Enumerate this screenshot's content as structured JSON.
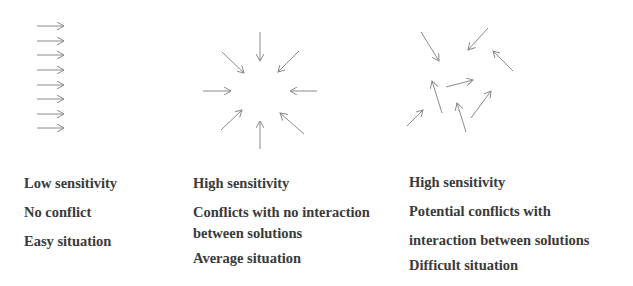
{
  "arrow_color": "#8a8a8a",
  "text_color": "#3a3a3a",
  "panels": [
    {
      "name": "parallel",
      "arrows": [
        [
          37,
          26,
          64,
          26
        ],
        [
          37,
          41,
          64,
          41
        ],
        [
          37,
          55,
          64,
          55
        ],
        [
          37,
          70,
          64,
          70
        ],
        [
          37,
          85,
          64,
          85
        ],
        [
          37,
          99,
          64,
          99
        ],
        [
          37,
          114,
          64,
          114
        ],
        [
          37,
          128,
          64,
          128
        ]
      ],
      "lines": [
        "Low sensitivity",
        "No conflict",
        "Easy situation"
      ]
    },
    {
      "name": "converging",
      "arrows": [
        [
          260,
          32,
          260,
          61
        ],
        [
          222,
          52,
          244,
          73
        ],
        [
          299,
          51,
          278,
          72
        ],
        [
          203,
          91,
          231,
          91
        ],
        [
          317,
          91,
          290,
          91
        ],
        [
          221,
          130,
          242,
          110
        ],
        [
          260,
          149,
          260,
          121
        ],
        [
          304,
          134,
          280,
          113
        ]
      ],
      "lines": [
        "High sensitivity",
        "Conflicts with no interaction",
        "between solutions",
        "Average situation"
      ]
    },
    {
      "name": "scattered",
      "arrows": [
        [
          421,
          32,
          439,
          61
        ],
        [
          488,
          28,
          468,
          50
        ],
        [
          513,
          71,
          493,
          51
        ],
        [
          446,
          87,
          473,
          80
        ],
        [
          442,
          113,
          432,
          81
        ],
        [
          407,
          126,
          423,
          110
        ],
        [
          466,
          132,
          457,
          103
        ],
        [
          471,
          118,
          491,
          91
        ]
      ],
      "lines": [
        "High sensitivity",
        "Potential conflicts with",
        "interaction between solutions",
        "Difficult situation"
      ]
    }
  ]
}
